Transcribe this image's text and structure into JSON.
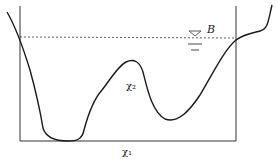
{
  "diagram": {
    "labels": {
      "water_level": "B",
      "inner_region": "χ₂",
      "bottom": "χ₁"
    },
    "colors": {
      "line": "#1a1a1a",
      "background": "#ffffff"
    }
  }
}
